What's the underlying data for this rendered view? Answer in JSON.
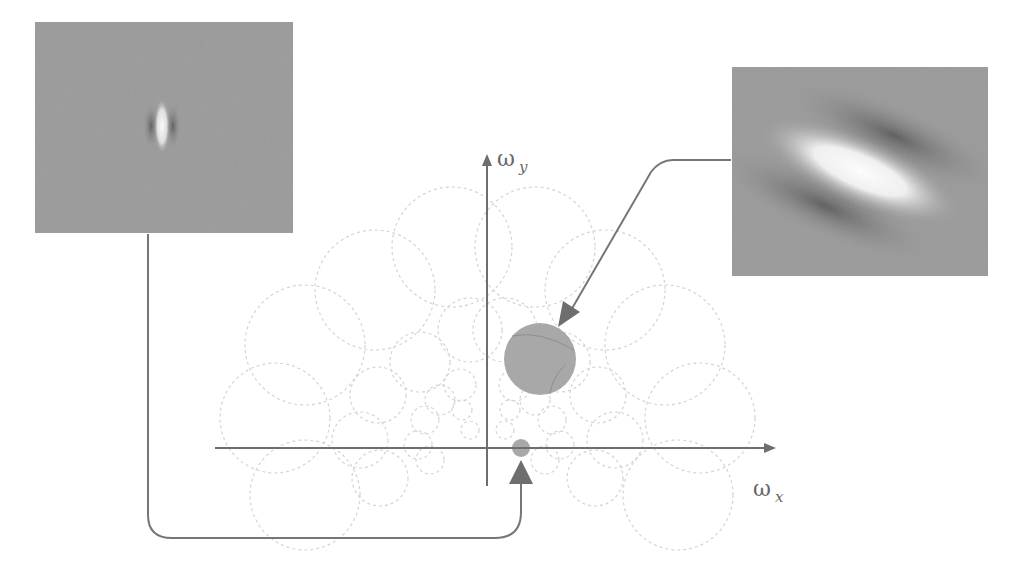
{
  "diagram": {
    "type": "gabor-frequency-tiling",
    "colors": {
      "axis": "#6e6e6e",
      "connector": "#767676",
      "arrowhead": "#6e6e6e",
      "tiling_circles": "#d4d4d4",
      "highlight_fill": "#a8a8a8",
      "panel_bg": "#9a9a9a"
    },
    "axes": {
      "x_label": "ω",
      "x_sub": "x",
      "y_label": "ω",
      "y_sub": "y"
    },
    "panels": [
      {
        "id": "left-filter",
        "description": "small-scale vertical Gabor filter (spatial domain)"
      },
      {
        "id": "right-filter",
        "description": "large-scale oriented Gabor filter (spatial domain)"
      }
    ],
    "highlights": [
      {
        "id": "large-highlight",
        "cx": 540,
        "cy": 359,
        "r": 36
      },
      {
        "id": "small-highlight",
        "cx": 521,
        "cy": 448,
        "r": 9
      }
    ]
  }
}
